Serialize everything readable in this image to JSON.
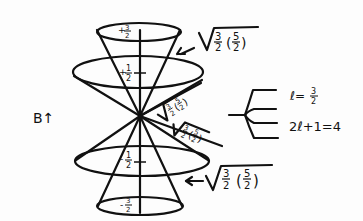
{
  "diagram": {
    "field_label": "B↑",
    "cone_levels": [
      {
        "m_label_sign": "+",
        "m_num": "3",
        "m_den": "2"
      },
      {
        "m_label_sign": "+",
        "m_num": "1",
        "m_den": "2"
      },
      {
        "m_label_sign": "-",
        "m_num": "1",
        "m_den": "2"
      },
      {
        "m_label_sign": "-",
        "m_num": "3",
        "m_den": "2"
      }
    ],
    "magnitude_labels": {
      "top": {
        "text": "√(3/2 (5/2))",
        "num1": "3",
        "den1": "2",
        "num2": "5",
        "den2": "2"
      },
      "diag_upper": {
        "text": "√(3/2 (5/2))"
      },
      "diag_lower": {
        "text": "√(3/2 (5/2))"
      },
      "bottom": {
        "text": "√(3/2 (5/2))",
        "num1": "3",
        "den1": "2",
        "num2": "5",
        "den2": "2"
      }
    },
    "splitting": {
      "l_label": "l = 3/2",
      "l_prefix": "ℓ=",
      "l_num": "3",
      "l_den": "2",
      "multiplicity": "2ℓ+1=4",
      "branch_count": 4
    }
  }
}
